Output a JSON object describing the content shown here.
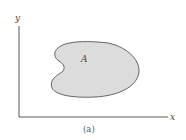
{
  "figure": {
    "axes": {
      "y_label": "y",
      "x_label": "x"
    },
    "region": {
      "label": "A",
      "fill_color": "#dcdcdc",
      "stroke_color": "#555555"
    },
    "caption": "(a)",
    "colors": {
      "axis": "#444444",
      "background": "#ffffff"
    }
  }
}
